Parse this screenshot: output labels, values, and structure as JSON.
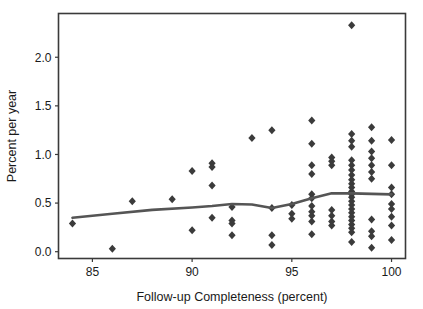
{
  "chart_data": {
    "type": "scatter",
    "title": "",
    "subtitle": "",
    "xlabel": "Follow-up Completeness (percent)",
    "ylabel": "Percent per year",
    "xlim": [
      83.3,
      100.7
    ],
    "ylim": [
      -0.07,
      2.45
    ],
    "xticks": [
      85,
      90,
      95,
      100
    ],
    "xtick_labels": [
      "85",
      "90",
      "95",
      "100"
    ],
    "yticks": [
      0.0,
      0.5,
      1.0,
      1.5,
      2.0
    ],
    "ytick_labels": [
      "0.0",
      "0.5",
      "1.0",
      "1.5",
      "2.0"
    ],
    "grid": false,
    "legend": null,
    "legend_position": "none",
    "marker_shape": "diamond",
    "marker_color": "#3b3b3b",
    "line_color": "#555555",
    "frame_color": "#3a3a3a",
    "background_color": "#ffffff",
    "series": [
      {
        "name": "Studies",
        "type": "scatter",
        "points": [
          [
            84.0,
            0.29
          ],
          [
            86.0,
            0.03
          ],
          [
            87.0,
            0.52
          ],
          [
            89.0,
            0.54
          ],
          [
            90.0,
            0.83
          ],
          [
            90.0,
            0.22
          ],
          [
            91.0,
            0.91
          ],
          [
            91.0,
            0.87
          ],
          [
            91.0,
            0.68
          ],
          [
            91.0,
            0.35
          ],
          [
            92.0,
            0.46
          ],
          [
            92.0,
            0.32
          ],
          [
            92.0,
            0.29
          ],
          [
            92.0,
            0.17
          ],
          [
            93.0,
            1.17
          ],
          [
            94.0,
            1.25
          ],
          [
            94.0,
            0.45
          ],
          [
            94.0,
            0.17
          ],
          [
            94.0,
            0.07
          ],
          [
            95.0,
            0.48
          ],
          [
            95.0,
            0.39
          ],
          [
            95.0,
            0.34
          ],
          [
            96.0,
            1.35
          ],
          [
            96.0,
            1.11
          ],
          [
            96.0,
            0.89
          ],
          [
            96.0,
            0.8
          ],
          [
            96.0,
            0.59
          ],
          [
            96.0,
            0.55
          ],
          [
            96.0,
            0.47
          ],
          [
            96.0,
            0.41
          ],
          [
            96.0,
            0.37
          ],
          [
            96.0,
            0.31
          ],
          [
            96.0,
            0.18
          ],
          [
            97.0,
            0.97
          ],
          [
            97.0,
            0.93
          ],
          [
            97.0,
            0.89
          ],
          [
            97.0,
            0.43
          ],
          [
            97.0,
            0.37
          ],
          [
            97.0,
            0.31
          ],
          [
            97.0,
            0.27
          ],
          [
            98.0,
            2.33
          ],
          [
            98.0,
            1.21
          ],
          [
            98.0,
            1.14
          ],
          [
            98.0,
            1.08
          ],
          [
            98.0,
            0.94
          ],
          [
            98.0,
            0.89
          ],
          [
            98.0,
            0.84
          ],
          [
            98.0,
            0.79
          ],
          [
            98.0,
            0.74
          ],
          [
            98.0,
            0.7
          ],
          [
            98.0,
            0.66
          ],
          [
            98.0,
            0.62
          ],
          [
            98.0,
            0.59
          ],
          [
            98.0,
            0.56
          ],
          [
            98.0,
            0.52
          ],
          [
            98.0,
            0.48
          ],
          [
            98.0,
            0.44
          ],
          [
            98.0,
            0.4
          ],
          [
            98.0,
            0.36
          ],
          [
            98.0,
            0.32
          ],
          [
            98.0,
            0.28
          ],
          [
            98.0,
            0.24
          ],
          [
            98.0,
            0.2
          ],
          [
            98.0,
            0.1
          ],
          [
            99.0,
            1.28
          ],
          [
            99.0,
            1.14
          ],
          [
            99.0,
            1.03
          ],
          [
            99.0,
            0.96
          ],
          [
            99.0,
            0.89
          ],
          [
            99.0,
            0.82
          ],
          [
            99.0,
            0.75
          ],
          [
            99.0,
            0.33
          ],
          [
            99.0,
            0.21
          ],
          [
            99.0,
            0.16
          ],
          [
            99.0,
            0.04
          ],
          [
            100.0,
            1.15
          ],
          [
            100.0,
            0.89
          ],
          [
            100.0,
            0.66
          ],
          [
            100.0,
            0.59
          ],
          [
            100.0,
            0.49
          ],
          [
            100.0,
            0.44
          ],
          [
            100.0,
            0.36
          ],
          [
            100.0,
            0.27
          ],
          [
            100.0,
            0.12
          ]
        ]
      },
      {
        "name": "Smoothed trend",
        "type": "line",
        "points": [
          [
            84.0,
            0.35
          ],
          [
            86.0,
            0.39
          ],
          [
            88.0,
            0.43
          ],
          [
            90.0,
            0.455
          ],
          [
            91.0,
            0.47
          ],
          [
            92.0,
            0.49
          ],
          [
            93.0,
            0.485
          ],
          [
            94.0,
            0.45
          ],
          [
            95.0,
            0.49
          ],
          [
            96.0,
            0.55
          ],
          [
            97.0,
            0.6
          ],
          [
            98.0,
            0.6
          ],
          [
            99.0,
            0.595
          ],
          [
            100.0,
            0.59
          ]
        ]
      }
    ]
  }
}
